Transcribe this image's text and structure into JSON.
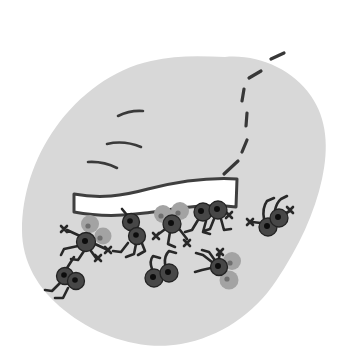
{
  "figure": {
    "canvas": {
      "width": 357,
      "height": 364,
      "background": "#ffffff"
    },
    "palette": {
      "blob": "#d8d8d8",
      "ink": "#3a3a3a",
      "plank_fill": "#ffffff",
      "plank_outline": "#3f3f3f",
      "ant_body": "#474747",
      "ant_body_edge": "#232323",
      "ant_eye_dot": "#0d0d0d",
      "cargo_ball": "#a3a3a3",
      "cargo_dot": "#6f6f6f",
      "legs": "#282828"
    },
    "shapes": [
      {
        "name": "blob-body",
        "kind": "path",
        "attrs": {
          "d": "M225,57 C258,54 292,69 311,96 C327,119 329,148 322,179 C315,212 299,247 276,281 C254,314 220,337 181,344 C142,351 97,337 64,310 C38,289 22,262 22,230 C22,196 33,159 56,127 C79,95 113,69 151,61 C176,55 201,56 225,57 Z",
          "fill": "#d8d8d8",
          "stroke": "none"
        }
      },
      {
        "name": "motion-stroke-1",
        "kind": "path",
        "attrs": {
          "d": "M118,116 Q130,110 143,111",
          "fill": "none",
          "stroke": "#3a3a3a",
          "stroke-width": "2.6"
        }
      },
      {
        "name": "motion-stroke-2",
        "kind": "path",
        "attrs": {
          "d": "M107,144 Q124,140 141,147",
          "fill": "none",
          "stroke": "#3a3a3a",
          "stroke-width": "2.6"
        }
      },
      {
        "name": "motion-stroke-3",
        "kind": "path",
        "attrs": {
          "d": "M88,162 Q103,161 117,168",
          "fill": "none",
          "stroke": "#3a3a3a",
          "stroke-width": "2.6"
        }
      },
      {
        "name": "dashed-trail",
        "kind": "path",
        "attrs": {
          "d": "M224,174 L238,161 M242,152 L247,140 M246,126 L247,113 M242,101 L244,89 M249,78 L261,71 M271,59 L284,53",
          "fill": "none",
          "stroke": "#383838",
          "stroke-width": "3.2"
        }
      },
      {
        "name": "plank",
        "kind": "path",
        "attrs": {
          "d": "M74,194 C100,199 122,196 148,189 C176,182 205,177 237,179 L236,207 C205,203 175,209 145,213 C116,217 90,215 74,212 Z",
          "fill": "#ffffff",
          "stroke": "#3f3f3f",
          "stroke-width": "3"
        }
      },
      {
        "name": "ant-plank-left-legs",
        "kind": "path",
        "attrs": {
          "d": "M80,236 L67,230 M61,226 L67,232 M67,226 L61,232 M78,246 L64,249 L61,255 M84,251 L78,260 L71,259 M91,251 L96,258 M95,255 L101,261 M101,255 L95,261 M95,244 L108,250 M105,247 L111,253 M111,247 L105,253",
          "fill": "none",
          "stroke": "#282828",
          "stroke-width": "2.6"
        }
      },
      {
        "name": "ant-plank-left-cargo-1",
        "kind": "circle",
        "attrs": {
          "cx": "90",
          "cy": "224",
          "r": "9",
          "fill": "#a3a3a3"
        }
      },
      {
        "name": "ant-plank-left-cargo-1-dot",
        "kind": "circle",
        "attrs": {
          "cx": "88",
          "cy": "226",
          "r": "2.6",
          "fill": "#6f6f6f"
        }
      },
      {
        "name": "ant-plank-left-cargo-2",
        "kind": "circle",
        "attrs": {
          "cx": "103",
          "cy": "236",
          "r": "8.5",
          "fill": "#a3a3a3"
        }
      },
      {
        "name": "ant-plank-left-cargo-2-dot",
        "kind": "circle",
        "attrs": {
          "cx": "100",
          "cy": "238",
          "r": "2.6",
          "fill": "#6f6f6f"
        }
      },
      {
        "name": "ant-plank-left-body",
        "kind": "circle",
        "attrs": {
          "cx": "86",
          "cy": "242",
          "r": "9.5",
          "fill": "#474747",
          "stroke": "#232323",
          "stroke-width": "1.3"
        }
      },
      {
        "name": "ant-plank-left-body-dot",
        "kind": "circle",
        "attrs": {
          "cx": "85",
          "cy": "241",
          "r": "3",
          "fill": "#0d0d0d"
        }
      },
      {
        "name": "ant-plank-midleft-legs",
        "kind": "path",
        "attrs": {
          "d": "M127,215 L122,209 M128,243 L121,252 L113,251 M136,244 L134,254 L126,257 M141,241 L145,251 L138,255",
          "fill": "none",
          "stroke": "#282828",
          "stroke-width": "2.6"
        }
      },
      {
        "name": "ant-plank-midleft-body-1",
        "kind": "circle",
        "attrs": {
          "cx": "131",
          "cy": "222",
          "r": "8.5",
          "fill": "#474747",
          "stroke": "#232323",
          "stroke-width": "1.3"
        }
      },
      {
        "name": "ant-plank-midleft-body-1-dot",
        "kind": "circle",
        "attrs": {
          "cx": "130",
          "cy": "221",
          "r": "2.8",
          "fill": "#0d0d0d"
        }
      },
      {
        "name": "ant-plank-midleft-body-2",
        "kind": "circle",
        "attrs": {
          "cx": "137",
          "cy": "236",
          "r": "8.5",
          "fill": "#474747",
          "stroke": "#232323",
          "stroke-width": "1.3"
        }
      },
      {
        "name": "ant-plank-midleft-body-2-dot",
        "kind": "circle",
        "attrs": {
          "cx": "136",
          "cy": "235",
          "r": "2.8",
          "fill": "#0d0d0d"
        }
      },
      {
        "name": "ant-plank-center-legs",
        "kind": "path",
        "attrs": {
          "d": "M164,230 L156,236 M153,233 L159,239 M159,233 L153,239 M170,232 L168,244 L175,247 M180,230 L187,239 M184,240 L190,246 M190,240 L184,246",
          "fill": "none",
          "stroke": "#282828",
          "stroke-width": "2.6"
        }
      },
      {
        "name": "ant-plank-center-cargo-1",
        "kind": "circle",
        "attrs": {
          "cx": "163",
          "cy": "214",
          "r": "9",
          "fill": "#a3a3a3"
        }
      },
      {
        "name": "ant-plank-center-cargo-1-dot",
        "kind": "circle",
        "attrs": {
          "cx": "161",
          "cy": "216",
          "r": "2.6",
          "fill": "#6f6f6f"
        }
      },
      {
        "name": "ant-plank-center-cargo-2",
        "kind": "circle",
        "attrs": {
          "cx": "180",
          "cy": "211",
          "r": "9",
          "fill": "#a3a3a3"
        }
      },
      {
        "name": "ant-plank-center-cargo-2-dot",
        "kind": "circle",
        "attrs": {
          "cx": "178",
          "cy": "213",
          "r": "2.6",
          "fill": "#6f6f6f"
        }
      },
      {
        "name": "ant-plank-center-body",
        "kind": "circle",
        "attrs": {
          "cx": "172",
          "cy": "224",
          "r": "9",
          "fill": "#474747",
          "stroke": "#232323",
          "stroke-width": "1.3"
        }
      },
      {
        "name": "ant-plank-center-body-dot",
        "kind": "circle",
        "attrs": {
          "cx": "171",
          "cy": "223",
          "r": "3",
          "fill": "#0d0d0d"
        }
      },
      {
        "name": "ant-plank-right-pair-legs",
        "kind": "path",
        "attrs": {
          "d": "M198,220 L192,230 L185,232 M206,221 L203,232 L210,234 M214,219 L210,229 L204,231 M221,219 L224,230 L231,229 M225,212 L229,215 M226,212 L232,218 M232,212 L226,218",
          "fill": "none",
          "stroke": "#282828",
          "stroke-width": "2.6"
        }
      },
      {
        "name": "ant-plank-right-body-1",
        "kind": "circle",
        "attrs": {
          "cx": "203",
          "cy": "212",
          "r": "9",
          "fill": "#474747",
          "stroke": "#232323",
          "stroke-width": "1.3"
        }
      },
      {
        "name": "ant-plank-right-body-1-dot",
        "kind": "circle",
        "attrs": {
          "cx": "201",
          "cy": "211",
          "r": "3",
          "fill": "#0d0d0d"
        }
      },
      {
        "name": "ant-plank-right-body-2",
        "kind": "circle",
        "attrs": {
          "cx": "218",
          "cy": "210",
          "r": "9",
          "fill": "#474747",
          "stroke": "#232323",
          "stroke-width": "1.3"
        }
      },
      {
        "name": "ant-plank-right-body-2-dot",
        "kind": "circle",
        "attrs": {
          "cx": "217",
          "cy": "209",
          "r": "3",
          "fill": "#0d0d0d"
        }
      },
      {
        "name": "ant-right-overturned-legs",
        "kind": "path",
        "attrs": {
          "d": "M264,219 Q262,208 267,201 L274,198 M275,210 Q277,202 281,199 L287,196 M261,223 L252,222 M247,219 L253,225 M253,219 L247,225 M284,214 L290,211 M287,207 L293,213 M293,207 L287,213",
          "fill": "none",
          "stroke": "#282828",
          "stroke-width": "2.6"
        }
      },
      {
        "name": "ant-right-overturned-body-1",
        "kind": "circle",
        "attrs": {
          "cx": "268",
          "cy": "227",
          "r": "9",
          "fill": "#474747",
          "stroke": "#232323",
          "stroke-width": "1.3"
        }
      },
      {
        "name": "ant-right-overturned-body-1-dot",
        "kind": "circle",
        "attrs": {
          "cx": "267",
          "cy": "226",
          "r": "3",
          "fill": "#0d0d0d"
        }
      },
      {
        "name": "ant-right-overturned-body-2",
        "kind": "circle",
        "attrs": {
          "cx": "279",
          "cy": "218",
          "r": "9",
          "fill": "#474747",
          "stroke": "#232323",
          "stroke-width": "1.3"
        }
      },
      {
        "name": "ant-right-overturned-body-2-dot",
        "kind": "circle",
        "attrs": {
          "cx": "278",
          "cy": "217",
          "r": "3",
          "fill": "#0d0d0d"
        }
      },
      {
        "name": "ant-bottom-left-legs",
        "kind": "path",
        "attrs": {
          "d": "M60,283 L52,291 L45,290 M68,288 L63,298 L55,298 M67,268 L74,257",
          "fill": "none",
          "stroke": "#282828",
          "stroke-width": "2.6"
        }
      },
      {
        "name": "ant-bottom-left-body-1",
        "kind": "circle",
        "attrs": {
          "cx": "65",
          "cy": "276",
          "r": "8.5",
          "fill": "#474747",
          "stroke": "#232323",
          "stroke-width": "1.3"
        }
      },
      {
        "name": "ant-bottom-left-body-1-dot",
        "kind": "circle",
        "attrs": {
          "cx": "64",
          "cy": "275",
          "r": "2.8",
          "fill": "#0d0d0d"
        }
      },
      {
        "name": "ant-bottom-left-body-2",
        "kind": "circle",
        "attrs": {
          "cx": "76",
          "cy": "281",
          "r": "8.5",
          "fill": "#474747",
          "stroke": "#232323",
          "stroke-width": "1.3"
        }
      },
      {
        "name": "ant-bottom-left-body-2-dot",
        "kind": "circle",
        "attrs": {
          "cx": "75",
          "cy": "280",
          "r": "2.8",
          "fill": "#0d0d0d"
        }
      },
      {
        "name": "ant-bottom-center-overturned-legs",
        "kind": "path",
        "attrs": {
          "d": "M152,269 Q149,261 153,256 L160,258 M165,264 Q164,256 169,251 L176,253",
          "fill": "none",
          "stroke": "#282828",
          "stroke-width": "2.6"
        }
      },
      {
        "name": "ant-bottom-center-body-1",
        "kind": "circle",
        "attrs": {
          "cx": "154",
          "cy": "278",
          "r": "9",
          "fill": "#474747",
          "stroke": "#232323",
          "stroke-width": "1.3"
        }
      },
      {
        "name": "ant-bottom-center-body-1-dot",
        "kind": "circle",
        "attrs": {
          "cx": "153",
          "cy": "277",
          "r": "3",
          "fill": "#0d0d0d"
        }
      },
      {
        "name": "ant-bottom-center-body-2",
        "kind": "circle",
        "attrs": {
          "cx": "169",
          "cy": "273",
          "r": "9",
          "fill": "#474747",
          "stroke": "#232323",
          "stroke-width": "1.3"
        }
      },
      {
        "name": "ant-bottom-center-body-2-dot",
        "kind": "circle",
        "attrs": {
          "cx": "168",
          "cy": "272",
          "r": "3",
          "fill": "#0d0d0d"
        }
      },
      {
        "name": "ant-bottom-right-legs",
        "kind": "path",
        "attrs": {
          "d": "M212,262 L203,255 L196,253 M211,268 L202,270 L195,272 M214,259 L209,252 L202,250 M219,258 L220,252 M217,249 L223,255 M223,249 L217,255",
          "fill": "none",
          "stroke": "#282828",
          "stroke-width": "2.6"
        }
      },
      {
        "name": "ant-bottom-right-cargo-1",
        "kind": "circle",
        "attrs": {
          "cx": "232",
          "cy": "261",
          "r": "9",
          "fill": "#a3a3a3"
        }
      },
      {
        "name": "ant-bottom-right-cargo-1-dot",
        "kind": "circle",
        "attrs": {
          "cx": "230",
          "cy": "263",
          "r": "2.6",
          "fill": "#6f6f6f"
        }
      },
      {
        "name": "ant-bottom-right-cargo-2",
        "kind": "circle",
        "attrs": {
          "cx": "229",
          "cy": "280",
          "r": "9.5",
          "fill": "#a3a3a3"
        }
      },
      {
        "name": "ant-bottom-right-cargo-2-dot",
        "kind": "circle",
        "attrs": {
          "cx": "227",
          "cy": "279",
          "r": "2.6",
          "fill": "#6f6f6f"
        }
      },
      {
        "name": "ant-bottom-right-body",
        "kind": "circle",
        "attrs": {
          "cx": "219",
          "cy": "267",
          "r": "8.5",
          "fill": "#474747",
          "stroke": "#232323",
          "stroke-width": "1.3"
        }
      },
      {
        "name": "ant-bottom-right-body-dot",
        "kind": "circle",
        "attrs": {
          "cx": "218",
          "cy": "266",
          "r": "3",
          "fill": "#0d0d0d"
        }
      }
    ]
  }
}
